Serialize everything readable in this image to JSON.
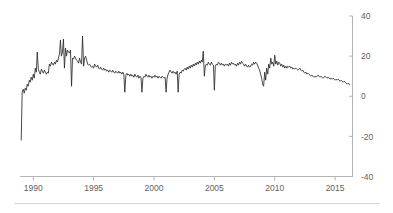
{
  "chart_data": {
    "type": "line",
    "title": "",
    "subtitle": "",
    "xlabel": "",
    "ylabel": "",
    "xlim": [
      1988.9,
      2016.4
    ],
    "ylim": [
      -40,
      40
    ],
    "grid": false,
    "legend_position": "none",
    "y_axis_side": "right",
    "x_ticks": [
      1990,
      1995,
      2000,
      2005,
      2010,
      2015
    ],
    "x_tick_labels": [
      "1990",
      "1995",
      "2000",
      "2005",
      "2010",
      "2015"
    ],
    "y_ticks": [
      -40,
      -20,
      0,
      20,
      40
    ],
    "y_tick_labels": [
      "-40",
      "-20",
      "0",
      "20",
      "40"
    ],
    "series": [
      {
        "name": "series-1",
        "color": "#2b2b2b",
        "x": [
          1989.0,
          1989.08,
          1989.17,
          1989.25,
          1989.33,
          1989.42,
          1989.5,
          1989.58,
          1989.67,
          1989.75,
          1989.83,
          1989.92,
          1990.0,
          1990.08,
          1990.17,
          1990.25,
          1990.33,
          1990.42,
          1990.5,
          1990.58,
          1990.67,
          1990.75,
          1990.83,
          1990.92,
          1991.0,
          1991.08,
          1991.17,
          1991.25,
          1991.33,
          1991.42,
          1991.5,
          1991.58,
          1991.67,
          1991.75,
          1991.83,
          1991.92,
          1992.0,
          1992.08,
          1992.17,
          1992.25,
          1992.33,
          1992.42,
          1992.5,
          1992.58,
          1992.67,
          1992.75,
          1992.83,
          1992.92,
          1993.0,
          1993.08,
          1993.17,
          1993.25,
          1993.33,
          1993.42,
          1993.5,
          1993.58,
          1993.67,
          1993.75,
          1993.83,
          1993.92,
          1994.0,
          1994.08,
          1994.17,
          1994.25,
          1994.33,
          1994.42,
          1994.5,
          1994.58,
          1994.67,
          1994.75,
          1994.83,
          1994.92,
          1995.0,
          1995.08,
          1995.17,
          1995.25,
          1995.33,
          1995.42,
          1995.5,
          1995.58,
          1995.67,
          1995.75,
          1995.83,
          1995.92,
          1996.0,
          1996.08,
          1996.17,
          1996.25,
          1996.33,
          1996.42,
          1996.5,
          1996.58,
          1996.67,
          1996.75,
          1996.83,
          1996.92,
          1997.0,
          1997.08,
          1997.17,
          1997.25,
          1997.33,
          1997.42,
          1997.5,
          1997.58,
          1997.67,
          1997.75,
          1997.83,
          1997.92,
          1998.0,
          1998.08,
          1998.17,
          1998.25,
          1998.33,
          1998.42,
          1998.5,
          1998.58,
          1998.67,
          1998.75,
          1998.83,
          1998.92,
          1999.0,
          1999.08,
          1999.17,
          1999.25,
          1999.33,
          1999.42,
          1999.5,
          1999.58,
          1999.67,
          1999.75,
          1999.83,
          1999.92,
          2000.0,
          2000.08,
          2000.17,
          2000.25,
          2000.33,
          2000.42,
          2000.5,
          2000.58,
          2000.67,
          2000.75,
          2000.83,
          2000.92,
          2001.0,
          2001.08,
          2001.17,
          2001.25,
          2001.33,
          2001.42,
          2001.5,
          2001.58,
          2001.67,
          2001.75,
          2001.83,
          2001.92,
          2002.0,
          2002.08,
          2002.17,
          2002.25,
          2002.33,
          2002.42,
          2002.5,
          2002.58,
          2002.67,
          2002.75,
          2002.83,
          2002.92,
          2003.0,
          2003.08,
          2003.17,
          2003.25,
          2003.33,
          2003.42,
          2003.5,
          2003.58,
          2003.67,
          2003.75,
          2003.83,
          2003.92,
          2004.0,
          2004.08,
          2004.17,
          2004.25,
          2004.33,
          2004.42,
          2004.5,
          2004.58,
          2004.67,
          2004.75,
          2004.83,
          2004.92,
          2005.0,
          2005.08,
          2005.17,
          2005.25,
          2005.33,
          2005.42,
          2005.5,
          2005.58,
          2005.67,
          2005.75,
          2005.83,
          2005.92,
          2006.0,
          2006.08,
          2006.17,
          2006.25,
          2006.33,
          2006.42,
          2006.5,
          2006.58,
          2006.67,
          2006.75,
          2006.83,
          2006.92,
          2007.0,
          2007.08,
          2007.17,
          2007.25,
          2007.33,
          2007.42,
          2007.5,
          2007.58,
          2007.67,
          2007.75,
          2007.83,
          2007.92,
          2008.0,
          2008.08,
          2008.17,
          2008.25,
          2008.33,
          2008.42,
          2008.5,
          2008.58,
          2008.67,
          2008.75,
          2008.83,
          2008.92,
          2009.0,
          2009.08,
          2009.17,
          2009.25,
          2009.33,
          2009.42,
          2009.5,
          2009.58,
          2009.67,
          2009.75,
          2009.83,
          2009.92,
          2010.0,
          2010.08,
          2010.17,
          2010.25,
          2010.33,
          2010.42,
          2010.5,
          2010.58,
          2010.67,
          2010.75,
          2010.83,
          2010.92,
          2011.0,
          2011.08,
          2011.17,
          2011.25,
          2011.33,
          2011.42,
          2011.5,
          2011.58,
          2011.67,
          2011.75,
          2011.83,
          2011.92,
          2012.0,
          2012.08,
          2012.17,
          2012.25,
          2012.33,
          2012.42,
          2012.5,
          2012.58,
          2012.67,
          2012.75,
          2012.83,
          2012.92,
          2013.0,
          2013.08,
          2013.17,
          2013.25,
          2013.33,
          2013.42,
          2013.5,
          2013.58,
          2013.67,
          2013.75,
          2013.83,
          2013.92,
          2014.0,
          2014.08,
          2014.17,
          2014.25,
          2014.33,
          2014.42,
          2014.5,
          2014.58,
          2014.67,
          2014.75,
          2014.83,
          2014.92,
          2015.0,
          2015.08,
          2015.17,
          2015.25,
          2015.33,
          2015.42,
          2015.5,
          2015.58,
          2015.67,
          2015.75,
          2015.83,
          2015.92,
          2016.0,
          2016.08,
          2016.17,
          2016.25
        ],
        "y": [
          -22.0,
          2.0,
          3.5,
          1.5,
          4.0,
          3.0,
          6.0,
          5.0,
          8.0,
          7.0,
          9.5,
          8.0,
          11.0,
          9.0,
          14.0,
          12.0,
          22.0,
          13.5,
          12.0,
          11.0,
          13.5,
          12.5,
          11.5,
          13.0,
          12.0,
          11.0,
          12.0,
          11.5,
          16.0,
          15.0,
          17.0,
          16.0,
          15.5,
          17.0,
          16.0,
          18.0,
          17.0,
          19.0,
          21.0,
          28.0,
          20.0,
          22.0,
          28.5,
          14.0,
          24.0,
          20.0,
          23.0,
          22.0,
          21.5,
          23.0,
          5.0,
          19.0,
          18.5,
          20.0,
          19.0,
          18.0,
          17.5,
          16.5,
          19.0,
          17.0,
          16.0,
          30.0,
          15.0,
          19.0,
          20.0,
          18.0,
          16.0,
          15.5,
          16.0,
          15.0,
          14.5,
          15.0,
          14.0,
          16.0,
          15.0,
          14.5,
          15.5,
          14.0,
          13.5,
          14.5,
          13.5,
          13.0,
          14.0,
          13.0,
          13.5,
          12.5,
          13.0,
          12.0,
          13.0,
          12.5,
          12.0,
          13.0,
          12.0,
          11.5,
          12.5,
          12.0,
          11.5,
          12.5,
          11.5,
          12.0,
          11.0,
          12.0,
          11.0,
          2.0,
          10.5,
          11.5,
          10.5,
          11.0,
          10.0,
          11.0,
          10.0,
          10.5,
          9.5,
          11.0,
          10.0,
          9.5,
          10.5,
          9.0,
          10.0,
          9.5,
          2.0,
          9.0,
          10.0,
          9.5,
          11.0,
          10.0,
          9.5,
          10.5,
          9.5,
          10.0,
          9.0,
          10.0,
          9.5,
          10.5,
          9.5,
          10.0,
          9.0,
          10.0,
          9.5,
          9.0,
          10.0,
          9.5,
          9.0,
          9.5,
          2.0,
          9.0,
          11.0,
          12.0,
          13.0,
          12.0,
          11.5,
          12.5,
          11.5,
          12.0,
          11.0,
          12.5,
          2.0,
          11.0,
          12.0,
          11.5,
          13.0,
          12.5,
          13.5,
          14.0,
          13.0,
          14.5,
          13.5,
          15.0,
          14.0,
          15.5,
          14.5,
          16.0,
          15.0,
          16.5,
          15.5,
          17.0,
          16.0,
          17.5,
          16.5,
          18.0,
          17.0,
          22.5,
          10.0,
          15.0,
          16.0,
          15.5,
          17.0,
          16.0,
          15.5,
          17.0,
          16.0,
          15.5,
          3.0,
          15.0,
          16.0,
          15.5,
          17.0,
          16.5,
          15.5,
          16.5,
          15.5,
          16.0,
          15.0,
          16.0,
          15.5,
          16.0,
          15.0,
          16.5,
          15.5,
          17.0,
          16.0,
          16.5,
          15.5,
          16.0,
          15.0,
          16.5,
          15.5,
          17.0,
          16.0,
          17.5,
          16.5,
          16.0,
          15.0,
          16.0,
          15.0,
          14.5,
          15.5,
          14.5,
          15.0,
          16.0,
          15.5,
          17.0,
          16.0,
          17.0,
          16.5,
          15.5,
          14.0,
          13.0,
          11.0,
          9.0,
          6.0,
          5.0,
          12.0,
          8.0,
          14.0,
          11.0,
          16.0,
          14.0,
          19.0,
          16.0,
          17.0,
          15.0,
          20.5,
          16.0,
          17.5,
          15.5,
          17.0,
          16.5,
          15.0,
          16.0,
          14.5,
          15.5,
          14.0,
          15.0,
          14.0,
          15.0,
          14.5,
          15.0,
          14.0,
          14.5,
          13.5,
          14.0,
          13.5,
          14.0,
          13.5,
          13.0,
          13.5,
          14.0,
          13.0,
          12.5,
          13.0,
          12.0,
          11.5,
          12.0,
          11.0,
          11.5,
          11.0,
          10.5,
          10.0,
          10.5,
          10.0,
          9.5,
          10.0,
          9.5,
          10.0,
          10.5,
          10.0,
          9.5,
          10.0,
          9.5,
          9.0,
          9.5,
          10.0,
          9.5,
          9.0,
          9.5,
          9.0,
          8.5,
          9.0,
          8.5,
          9.0,
          8.5,
          8.0,
          8.5,
          8.0,
          8.5,
          8.0,
          7.5,
          8.0,
          7.5,
          7.0,
          7.5,
          7.0,
          6.5,
          6.0,
          6.5,
          6.0,
          5.8
        ]
      }
    ]
  }
}
